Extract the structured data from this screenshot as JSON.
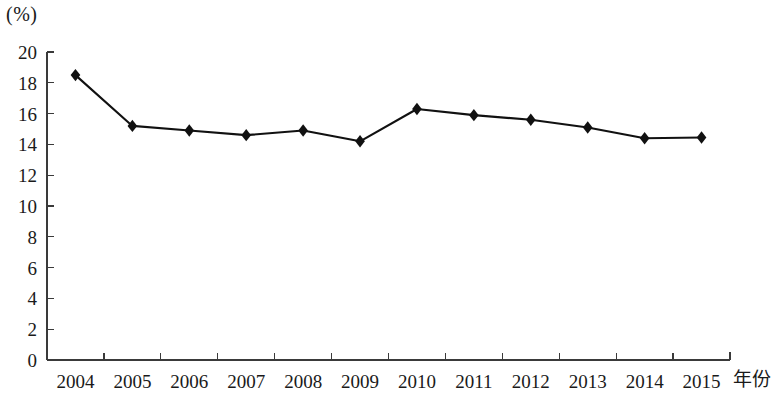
{
  "chart_data": {
    "type": "line",
    "title": "",
    "subtitle": "",
    "unit_label": "(%)",
    "xlabel": "年份",
    "ylabel": "",
    "ylim": [
      0,
      20
    ],
    "ytick_step": 2,
    "yticks": [
      0,
      2,
      4,
      6,
      8,
      10,
      12,
      14,
      16,
      18,
      20
    ],
    "grid": false,
    "legend": "none",
    "marker": "diamond",
    "line_color": "#111111",
    "marker_color": "#111111",
    "axis_color": "#3a3a3a",
    "categories": [
      "2004",
      "2005",
      "2006",
      "2007",
      "2008",
      "2009",
      "2010",
      "2011",
      "2012",
      "2013",
      "2014",
      "2015"
    ],
    "values": [
      18.5,
      15.2,
      14.9,
      14.6,
      14.9,
      14.2,
      16.3,
      15.9,
      15.6,
      15.1,
      14.4,
      14.45
    ],
    "series": [
      {
        "name": "",
        "values": [
          18.5,
          15.2,
          14.9,
          14.6,
          14.9,
          14.2,
          16.3,
          15.9,
          15.6,
          15.1,
          14.4,
          14.45
        ]
      }
    ]
  }
}
